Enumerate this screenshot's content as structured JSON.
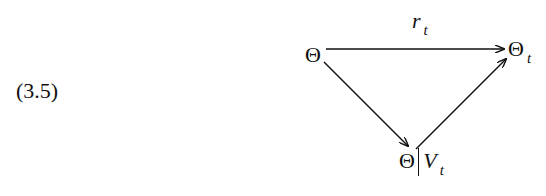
{
  "equation_number": "(3.5)",
  "diagram": {
    "nodes": {
      "left": {
        "symbol": "Θ"
      },
      "right": {
        "symbol": "Θ",
        "subscript": "t"
      },
      "bottom": {
        "symbol": "Θ",
        "separator": "|",
        "var": "V",
        "subscript": "t"
      }
    },
    "arrows": [
      {
        "from": "left",
        "to": "right",
        "label": "r",
        "label_subscript": "t"
      },
      {
        "from": "left",
        "to": "bottom",
        "label": ""
      },
      {
        "from": "bottom",
        "to": "right",
        "label": ""
      }
    ]
  }
}
